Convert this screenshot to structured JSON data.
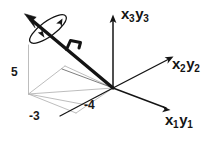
{
  "figure": {
    "kind": "3d-coordinate-axes-diagram",
    "background_color": "#ffffff",
    "ink_color": "#141414",
    "construction_line_color": "#b0b0b0",
    "width": 220,
    "height": 146
  },
  "axes": {
    "origin": {
      "x": 113,
      "y": 88
    },
    "items": [
      {
        "id": "x3y3",
        "label_main_1": "x",
        "label_sub_1": "3",
        "label_main_2": "y",
        "label_sub_2": "3",
        "direction": "vertical-up",
        "tip": {
          "x": 113,
          "y": 17
        }
      },
      {
        "id": "x2y2",
        "label_main_1": "x",
        "label_sub_1": "2",
        "label_main_2": "y",
        "label_sub_2": "2",
        "direction": "upper-right",
        "tip": {
          "x": 172,
          "y": 57
        }
      },
      {
        "id": "x1y1",
        "label_main_1": "x",
        "label_sub_1": "1",
        "label_main_2": "y",
        "label_sub_2": "1",
        "direction": "lower-right",
        "tip": {
          "x": 169,
          "y": 110
        }
      }
    ]
  },
  "value_labels": [
    {
      "id": "height-5",
      "text": "5"
    },
    {
      "id": "depth-minus-3",
      "text": "-3"
    },
    {
      "id": "width-minus-4",
      "text": "-4"
    }
  ],
  "vector": {
    "id": "resultant-vector",
    "from": {
      "x": 113,
      "y": 88
    },
    "to": {
      "x": 27,
      "y": 16
    },
    "stroke_width": 3.2,
    "has_arrowhead": true,
    "has_rotation_ellipse": true,
    "has_hook_marker": true
  }
}
